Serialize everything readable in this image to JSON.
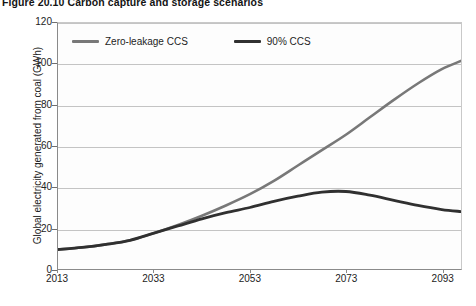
{
  "figure": {
    "title": "Figure 20.10 Carbon capture and storage scenarios"
  },
  "chart_data": {
    "type": "line",
    "title": "Figure 20.10 Carbon capture and storage scenarios",
    "xlabel": "",
    "ylabel": "Global electricity generated from coal (GWh)",
    "xlim": [
      2013,
      2097
    ],
    "ylim": [
      0,
      120
    ],
    "grid": true,
    "legend_position": "top-left-inside",
    "x_ticks": [
      "2013",
      "2033",
      "2053",
      "2073",
      "2093"
    ],
    "x_tick_values": [
      2013,
      2033,
      2053,
      2073,
      2093
    ],
    "y_ticks": [
      "0",
      "20",
      "40",
      "60",
      "80",
      "100",
      "120"
    ],
    "y_tick_values": [
      0,
      20,
      40,
      60,
      80,
      100,
      120
    ],
    "x": [
      2013,
      2018,
      2023,
      2028,
      2033,
      2038,
      2043,
      2048,
      2053,
      2058,
      2063,
      2068,
      2073,
      2078,
      2083,
      2088,
      2093,
      2097
    ],
    "series": [
      {
        "name": "Zero-leakage CCS",
        "color": "#787878",
        "width": 2.6,
        "values": [
          9.5,
          10.5,
          12.0,
          14.0,
          17.5,
          21.5,
          26.0,
          31.0,
          36.5,
          43.0,
          50.5,
          58.0,
          65.5,
          74.0,
          82.5,
          90.5,
          97.5,
          101.5
        ]
      },
      {
        "name": "90% CCS",
        "color": "#303030",
        "width": 2.8,
        "values": [
          9.5,
          10.5,
          12.0,
          14.0,
          17.5,
          21.0,
          24.5,
          27.5,
          30.0,
          33.0,
          35.5,
          37.5,
          37.8,
          36.0,
          33.5,
          31.0,
          29.0,
          28.0
        ]
      }
    ]
  },
  "legend": {
    "items": [
      {
        "label": "Zero-leakage CCS",
        "color": "#787878"
      },
      {
        "label": "90% CCS",
        "color": "#303030"
      }
    ]
  }
}
